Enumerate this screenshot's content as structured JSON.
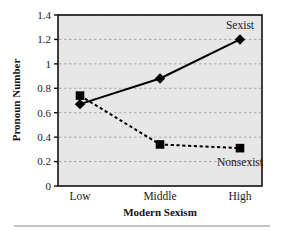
{
  "chart_data": {
    "type": "line",
    "title": "",
    "xlabel": "Modern Sexism",
    "ylabel": "Pronoun Number",
    "categories": [
      "Low",
      "Middle",
      "High"
    ],
    "ylim": [
      0,
      1.4
    ],
    "yticks": [
      "0",
      "0.2",
      "0.4",
      "0.6",
      "0.8",
      "1",
      "1.2",
      "1.4"
    ],
    "ytick_values": [
      0,
      0.2,
      0.4,
      0.6,
      0.8,
      1.0,
      1.2,
      1.4
    ],
    "grid": true,
    "legend_position": "inline-annotations",
    "series": [
      {
        "name": "Sexist",
        "values": [
          0.67,
          0.88,
          1.2
        ],
        "marker": "diamond",
        "linestyle": "solid",
        "color": "#000000",
        "annotation": "Sexist"
      },
      {
        "name": "Nonsexist",
        "values": [
          0.74,
          0.34,
          0.31
        ],
        "marker": "square",
        "linestyle": "dashed",
        "color": "#000000",
        "annotation": "Nonsexist"
      }
    ],
    "annotations": [
      {
        "text": "Sexist",
        "x_category": "High",
        "y": 1.32
      },
      {
        "text": "Nonsexist",
        "x_category": "High",
        "y": 0.2
      }
    ],
    "colors": {
      "plot_background": "#e7e7e7",
      "grid": "#9aa0b4",
      "axis": "#111111",
      "line": "#000000",
      "text": "#1a1a1a",
      "page_background": "#ffffff",
      "footer_rule": "#8a8a8a"
    }
  }
}
